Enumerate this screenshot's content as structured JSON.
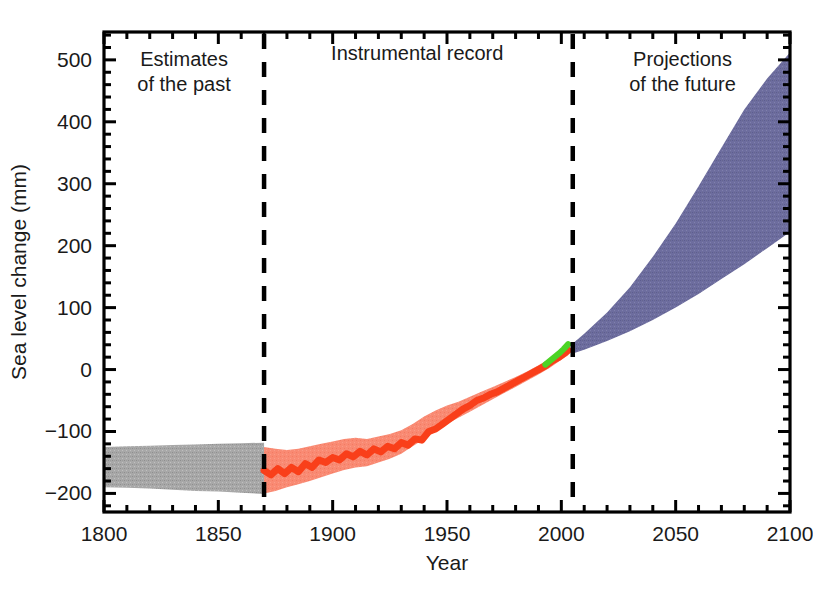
{
  "figure": {
    "background": "#ffffff",
    "frame_color": "#000000"
  },
  "chart_data": {
    "type": "area",
    "title": "",
    "xlabel": "Year",
    "ylabel": "Sea level change (mm)",
    "xlim": [
      1800,
      2100
    ],
    "ylim": [
      -230,
      545
    ],
    "xticks": [
      1800,
      1850,
      1900,
      1950,
      2000,
      2050,
      2100
    ],
    "xticklabels": [
      "1800",
      "1850",
      "1900",
      "1950",
      "2000",
      "2050",
      "2100"
    ],
    "x_minor_tick_interval": 10,
    "yticks": [
      -200,
      -100,
      0,
      100,
      200,
      300,
      400,
      500
    ],
    "yticklabels": [
      "−200",
      "−100",
      "0",
      "100",
      "200",
      "300",
      "400",
      "500"
    ],
    "y_minor_tick_interval": 20,
    "grid": false,
    "legend": "none",
    "annotations": [
      {
        "name": "estimates-of-the-past",
        "lines": [
          "Estimates",
          "of the past"
        ],
        "x": 1835,
        "y": 490
      },
      {
        "name": "instrumental-record",
        "lines": [
          "Instrumental record"
        ],
        "x": 1937,
        "y": 500
      },
      {
        "name": "projections-of-the-future",
        "lines": [
          "Projections",
          "of the future"
        ],
        "x": 2053,
        "y": 490
      }
    ],
    "dividers": [
      {
        "name": "divider-1870",
        "x": 1870,
        "style": "dashed",
        "color": "#000000"
      },
      {
        "name": "divider-2005",
        "x": 2005,
        "style": "dashed",
        "color": "#000000"
      }
    ],
    "series": [
      {
        "name": "Estimates of the past (proxy reconstruction)",
        "kind": "band",
        "color": "#9e9e9e",
        "x": [
          1800,
          1810,
          1820,
          1830,
          1840,
          1850,
          1860,
          1870
        ],
        "upper": [
          -125,
          -124,
          -123,
          -122,
          -121,
          -120,
          -119,
          -118
        ],
        "lower": [
          -190,
          -191,
          -192,
          -194,
          -196,
          -197,
          -199,
          -201
        ]
      },
      {
        "name": "Instrumental record uncertainty (tide gauges)",
        "kind": "band",
        "color": "#f98a73",
        "x": [
          1870,
          1875,
          1880,
          1885,
          1890,
          1895,
          1900,
          1905,
          1910,
          1915,
          1920,
          1925,
          1930,
          1935,
          1940,
          1945,
          1950,
          1955,
          1960,
          1965,
          1970,
          1975,
          1980,
          1985,
          1990,
          1995,
          2000,
          2003
        ],
        "upper": [
          -125,
          -128,
          -130,
          -128,
          -124,
          -120,
          -116,
          -112,
          -110,
          -112,
          -108,
          -104,
          -98,
          -88,
          -76,
          -66,
          -58,
          -52,
          -44,
          -36,
          -28,
          -20,
          -12,
          -3,
          7,
          18,
          31,
          38
        ],
        "lower": [
          -200,
          -196,
          -190,
          -185,
          -180,
          -174,
          -168,
          -162,
          -158,
          -156,
          -150,
          -144,
          -136,
          -124,
          -112,
          -100,
          -88,
          -78,
          -68,
          -58,
          -48,
          -38,
          -28,
          -18,
          -8,
          3,
          16,
          23
        ]
      },
      {
        "name": "Instrumental record mean (tide gauges)",
        "kind": "line",
        "color": "#f93f1a",
        "x": [
          1870,
          1873,
          1876,
          1879,
          1882,
          1885,
          1888,
          1891,
          1894,
          1897,
          1900,
          1903,
          1906,
          1909,
          1912,
          1915,
          1918,
          1921,
          1924,
          1927,
          1930,
          1933,
          1936,
          1939,
          1942,
          1945,
          1948,
          1951,
          1954,
          1957,
          1960,
          1963,
          1966,
          1969,
          1972,
          1975,
          1978,
          1981,
          1984,
          1987,
          1990,
          1993,
          1996,
          1999,
          2002,
          2003
        ],
        "y": [
          -163,
          -170,
          -160,
          -168,
          -158,
          -165,
          -152,
          -158,
          -146,
          -150,
          -142,
          -146,
          -136,
          -141,
          -132,
          -138,
          -128,
          -133,
          -124,
          -128,
          -118,
          -122,
          -112,
          -114,
          -100,
          -96,
          -88,
          -80,
          -72,
          -64,
          -58,
          -50,
          -46,
          -40,
          -36,
          -30,
          -24,
          -18,
          -12,
          -6,
          0,
          6,
          14,
          20,
          28,
          31
        ]
      },
      {
        "name": "Satellite altimetry",
        "kind": "line",
        "color": "#4cd425",
        "x": [
          1993,
          1995,
          1997,
          1999,
          2001,
          2003
        ],
        "y": [
          8,
          14,
          20,
          26,
          33,
          41
        ]
      },
      {
        "name": "Projections of the future",
        "kind": "band",
        "color": "#6a6a9c",
        "x": [
          2005,
          2010,
          2020,
          2030,
          2040,
          2050,
          2060,
          2070,
          2080,
          2090,
          2100
        ],
        "upper": [
          42,
          58,
          92,
          133,
          182,
          236,
          296,
          358,
          420,
          470,
          512
        ],
        "lower": [
          26,
          32,
          46,
          62,
          80,
          100,
          122,
          146,
          170,
          196,
          222
        ]
      }
    ]
  }
}
